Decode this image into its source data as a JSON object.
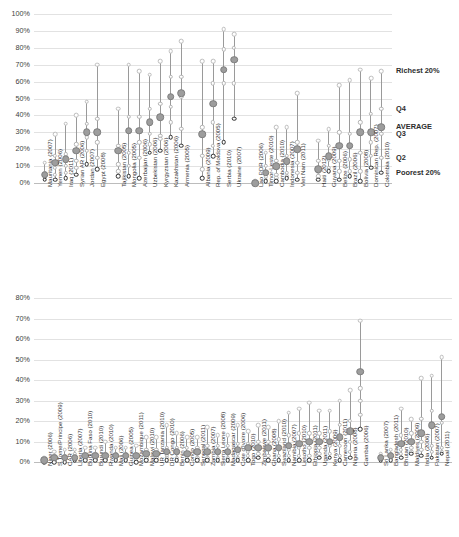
{
  "chart_data": [
    {
      "id": "top",
      "type": "scatter",
      "title": "",
      "xlabel": "",
      "ylabel": "",
      "ylim": [
        0,
        100
      ],
      "ytick_labels": [
        "0%",
        "10%",
        "20%",
        "30%",
        "40%",
        "50%",
        "60%",
        "70%",
        "80%",
        "90%",
        "100%"
      ],
      "ytick_values": [
        0,
        10,
        20,
        30,
        40,
        50,
        60,
        70,
        80,
        90,
        100
      ],
      "grid": true,
      "legend_position": "right",
      "series_names": [
        "Poorest 20%",
        "Q2",
        "Q3",
        "Q4",
        "Richest 20%",
        "AVERAGE"
      ],
      "legend": [
        {
          "label": "Richest 20%",
          "value": 66
        },
        {
          "label": "Q4",
          "value": 44
        },
        {
          "label": "AVERAGE",
          "value": 33
        },
        {
          "label": "Q3",
          "value": 29
        },
        {
          "label": "Q2",
          "value": 15
        },
        {
          "label": "Poorest 20%",
          "value": 6
        }
      ],
      "groups": [
        {
          "name": "group-1",
          "categories": [
            {
              "label": "Mauritania (2007)",
              "poorest": 2,
              "q2": 3,
              "q3": 4,
              "q4": 6,
              "richest": 12,
              "average": 5
            },
            {
              "label": "Yemen (2006)",
              "poorest": 2,
              "q2": 5,
              "q3": 9,
              "q4": 16,
              "richest": 29,
              "average": 12
            },
            {
              "label": "Iraq (2011)",
              "poorest": 3,
              "q2": 6,
              "q3": 10,
              "q4": 17,
              "richest": 35,
              "average": 14
            },
            {
              "label": "Syrian AR (2006)",
              "poorest": 5,
              "q2": 9,
              "q3": 13,
              "q4": 23,
              "richest": 40,
              "average": 19
            },
            {
              "label": "Jordan (2007)",
              "poorest": 11,
              "q2": 19,
              "q3": 27,
              "q4": 35,
              "richest": 48,
              "average": 30
            },
            {
              "label": "Egypt (2008)",
              "poorest": 8,
              "q2": 15,
              "q3": 24,
              "q4": 38,
              "richest": 70,
              "average": 30
            }
          ]
        },
        {
          "name": "group-2",
          "categories": [
            {
              "label": "Tajikistan (2005)",
              "poorest": 4,
              "q2": 7,
              "q3": 11,
              "q4": 22,
              "richest": 44,
              "average": 19
            },
            {
              "label": "Mongolia (2005)",
              "poorest": 4,
              "q2": 10,
              "q3": 18,
              "q4": 39,
              "richest": 70,
              "average": 31
            },
            {
              "label": "Azerbaijan (2006)",
              "poorest": 3,
              "q2": 15,
              "q3": 24,
              "q4": 39,
              "richest": 66,
              "average": 31
            },
            {
              "label": "Uzbekistan (2006)",
              "poorest": 18,
              "q2": 23,
              "q3": 29,
              "q4": 44,
              "richest": 64,
              "average": 36
            },
            {
              "label": "Kyrgyzstan (2006)",
              "poorest": 19,
              "q2": 26,
              "q3": 28,
              "q4": 47,
              "richest": 72,
              "average": 39
            },
            {
              "label": "Kazakhstan (2006)",
              "poorest": 27,
              "q2": 36,
              "q3": 45,
              "q4": 63,
              "richest": 78,
              "average": 51
            },
            {
              "label": "Armenia (2005)",
              "poorest": 22,
              "q2": 32,
              "q3": 51,
              "q4": 63,
              "richest": 84,
              "average": 53
            }
          ]
        },
        {
          "name": "group-3",
          "categories": [
            {
              "label": "Albania (2009)",
              "poorest": 3,
              "q2": 8,
              "q3": 16,
              "q4": 33,
              "richest": 72,
              "average": 29
            },
            {
              "label": "Rep. of Moldova (2005)",
              "poorest": 16,
              "q2": 22,
              "q3": 36,
              "q4": 59,
              "richest": 72,
              "average": 47
            },
            {
              "label": "Serbia (2010)",
              "poorest": 24,
              "q2": 59,
              "q3": 67,
              "q4": 79,
              "richest": 91,
              "average": 67
            },
            {
              "label": "Ukraine (2007)",
              "poorest": 38,
              "q2": 59,
              "q3": 73,
              "q4": 80,
              "richest": 88,
              "average": 73
            }
          ]
        },
        {
          "name": "group-4",
          "categories": [
            {
              "label": "Lao PDR (2006)",
              "poorest": 0,
              "q2": 0,
              "q3": 0,
              "q4": 0,
              "richest": 1,
              "average": 0
            },
            {
              "label": "Timor-Leste (2010)",
              "poorest": 1,
              "q2": 2,
              "q3": 4,
              "q4": 10,
              "richest": 18,
              "average": 6
            },
            {
              "label": "Cambodia (2010)",
              "poorest": 1,
              "q2": 3,
              "q3": 5,
              "q4": 13,
              "richest": 33,
              "average": 10
            },
            {
              "label": "Indonesia (2007)",
              "poorest": 3,
              "q2": 4,
              "q3": 6,
              "q4": 16,
              "richest": 33,
              "average": 13
            },
            {
              "label": "Viet Nam (2011)",
              "poorest": 2,
              "q2": 6,
              "q3": 12,
              "q4": 24,
              "richest": 53,
              "average": 20
            }
          ]
        },
        {
          "name": "group-5",
          "categories": [
            {
              "label": "Haiti (2012)",
              "poorest": 2,
              "q2": 4,
              "q3": 7,
              "q4": 13,
              "richest": 25,
              "average": 8
            },
            {
              "label": "Guyana (2009)",
              "poorest": 7,
              "q2": 9,
              "q3": 14,
              "q4": 22,
              "richest": 32,
              "average": 16
            },
            {
              "label": "Belize (2006)",
              "poorest": 2,
              "q2": 7,
              "q3": 13,
              "q4": 30,
              "richest": 58,
              "average": 22
            },
            {
              "label": "Brazil (2006)",
              "poorest": 4,
              "q2": 7,
              "q3": 14,
              "q4": 29,
              "richest": 61,
              "average": 22
            },
            {
              "label": "Bolivia (2008)",
              "poorest": 1,
              "q2": 7,
              "q3": 18,
              "q4": 36,
              "richest": 67,
              "average": 30
            },
            {
              "label": "Dominican Rep. (2007)",
              "poorest": 9,
              "q2": 16,
              "q3": 24,
              "q4": 41,
              "richest": 62,
              "average": 30
            },
            {
              "label": "Colombia (2010)",
              "poorest": 6,
              "q2": 15,
              "q3": 29,
              "q4": 44,
              "richest": 66,
              "average": 33
            }
          ]
        }
      ]
    },
    {
      "id": "bottom",
      "type": "scatter",
      "title": "",
      "xlabel": "",
      "ylabel": "",
      "ylim": [
        0,
        80
      ],
      "ytick_labels": [
        "0%",
        "10%",
        "20%",
        "30%",
        "40%",
        "50%",
        "60%",
        "70%",
        "80%"
      ],
      "ytick_values": [
        0,
        10,
        20,
        30,
        40,
        50,
        60,
        70,
        80
      ],
      "grid": true,
      "legend_position": "none",
      "series_names": [
        "Poorest 20%",
        "Q2",
        "Q3",
        "Q4",
        "Richest 20%",
        "AVERAGE"
      ],
      "groups": [
        {
          "name": "group-1",
          "categories": [
            {
              "label": "Niger (2006)",
              "poorest": 0,
              "q2": 0,
              "q3": 0,
              "q4": 1,
              "richest": 2,
              "average": 1
            },
            {
              "label": "S.Tome/Principe (2009)",
              "poorest": 0,
              "q2": 1,
              "q3": 2,
              "q4": 3,
              "richest": 5,
              "average": 2
            },
            {
              "label": "CAR (2006)",
              "poorest": 0,
              "q2": 1,
              "q3": 2,
              "q4": 3,
              "richest": 6,
              "average": 2
            },
            {
              "label": "Liberia (2007)",
              "poorest": 1,
              "q2": 1,
              "q3": 2,
              "q4": 4,
              "richest": 6,
              "average": 2
            },
            {
              "label": "Burkina Faso (2010)",
              "poorest": 1,
              "q2": 1,
              "q3": 2,
              "q4": 4,
              "richest": 7,
              "average": 3
            },
            {
              "label": "Burundi (2010)",
              "poorest": 1,
              "q2": 1,
              "q3": 2,
              "q4": 4,
              "richest": 7,
              "average": 3
            },
            {
              "label": "Rwanda (2010)",
              "poorest": 1,
              "q2": 1,
              "q3": 2,
              "q4": 4,
              "richest": 10,
              "average": 3
            },
            {
              "label": "Mali (2006)",
              "poorest": 1,
              "q2": 1,
              "q3": 2,
              "q4": 4,
              "richest": 7,
              "average": 3
            },
            {
              "label": "Guinea (2005)",
              "poorest": 1,
              "q2": 1,
              "q3": 2,
              "q4": 4,
              "richest": 7,
              "average": 3
            },
            {
              "label": "Mozambique (2011)",
              "poorest": 0,
              "q2": 1,
              "q3": 2,
              "q4": 4,
              "richest": 8,
              "average": 3
            },
            {
              "label": "Malawi (2010)",
              "poorest": 1,
              "q2": 2,
              "q3": 3,
              "q4": 6,
              "richest": 12,
              "average": 4
            },
            {
              "label": "UR Tanzania (2010)",
              "poorest": 1,
              "q2": 2,
              "q3": 3,
              "q4": 6,
              "richest": 12,
              "average": 4
            },
            {
              "label": "DR Congo (2010)",
              "poorest": 1,
              "q2": 2,
              "q3": 3,
              "q4": 7,
              "richest": 18,
              "average": 5
            },
            {
              "label": "Benin (2006)",
              "poorest": 1,
              "q2": 2,
              "q3": 4,
              "q4": 7,
              "richest": 14,
              "average": 5
            },
            {
              "label": "Congo (2005)",
              "poorest": 1,
              "q2": 2,
              "q3": 4,
              "q4": 7,
              "richest": 12,
              "average": 4
            },
            {
              "label": "Senegal (2011)",
              "poorest": 1,
              "q2": 2,
              "q3": 4,
              "q4": 7,
              "richest": 12,
              "average": 5
            },
            {
              "label": "Zambia (2007)",
              "poorest": 1,
              "q2": 2,
              "q3": 4,
              "q4": 8,
              "richest": 17,
              "average": 5
            },
            {
              "label": "Sierra Leone (2008)",
              "poorest": 1,
              "q2": 2,
              "q3": 4,
              "q4": 8,
              "richest": 13,
              "average": 5
            },
            {
              "label": "Madagascar (2009)",
              "poorest": 1,
              "q2": 2,
              "q3": 4,
              "q4": 8,
              "richest": 13,
              "average": 5
            },
            {
              "label": "Cote d'Ivoire (2006)",
              "poorest": 1,
              "q2": 2,
              "q3": 4,
              "q4": 9,
              "richest": 18,
              "average": 6
            },
            {
              "label": "Togo (2010)",
              "poorest": 1,
              "q2": 3,
              "q3": 5,
              "q4": 9,
              "richest": 15,
              "average": 7
            },
            {
              "label": "Zimbabwe (2011)",
              "poorest": 2,
              "q2": 4,
              "q3": 6,
              "q4": 10,
              "richest": 18,
              "average": 7
            },
            {
              "label": "Ghana (2008)",
              "poorest": 1,
              "q2": 3,
              "q3": 6,
              "q4": 10,
              "richest": 17,
              "average": 7
            },
            {
              "label": "Swaziland (2010)",
              "poorest": 1,
              "q2": 3,
              "q3": 6,
              "q4": 11,
              "richest": 20,
              "average": 7
            },
            {
              "label": "Namibia (2007)",
              "poorest": 1,
              "q2": 3,
              "q3": 6,
              "q4": 13,
              "richest": 24,
              "average": 8
            },
            {
              "label": "Lesotho (2010)",
              "poorest": 1,
              "q2": 3,
              "q3": 7,
              "q4": 14,
              "richest": 26,
              "average": 9
            },
            {
              "label": "Ethiopia (2011)",
              "poorest": 1,
              "q2": 3,
              "q3": 7,
              "q4": 14,
              "richest": 29,
              "average": 10
            },
            {
              "label": "Uganda (2011)",
              "poorest": 2,
              "q2": 4,
              "q3": 7,
              "q4": 14,
              "richest": 25,
              "average": 10
            },
            {
              "label": "Kenya (2009)",
              "poorest": 2,
              "q2": 4,
              "q3": 8,
              "q4": 15,
              "richest": 25,
              "average": 10
            },
            {
              "label": "Cameroon (2011)",
              "poorest": 1,
              "q2": 3,
              "q3": 8,
              "q4": 18,
              "richest": 30,
              "average": 12
            },
            {
              "label": "Nigeria (2008)",
              "poorest": 2,
              "q2": 5,
              "q3": 10,
              "q4": 20,
              "richest": 35,
              "average": 15
            },
            {
              "label": "Gambia (2006)",
              "poorest": 16,
              "q2": 23,
              "q3": 30,
              "q4": 36,
              "richest": 69,
              "average": 44
            }
          ]
        },
        {
          "name": "group-2",
          "categories": [
            {
              "label": "Sri Lanka (2007)",
              "poorest": 1,
              "q2": 1,
              "q3": 2,
              "q4": 3,
              "richest": 4,
              "average": 2
            },
            {
              "label": "Bangladesh (2011)",
              "poorest": 1,
              "q2": 2,
              "q3": 3,
              "q4": 4,
              "richest": 6,
              "average": 3
            },
            {
              "label": "Bhutan (2010)",
              "poorest": 2,
              "q2": 4,
              "q3": 6,
              "q4": 13,
              "richest": 26,
              "average": 9
            },
            {
              "label": "Maldives (2009)",
              "poorest": 4,
              "q2": 5,
              "q3": 7,
              "q4": 14,
              "richest": 21,
              "average": 10
            },
            {
              "label": "India (2006)",
              "poorest": 3,
              "q2": 6,
              "q3": 10,
              "q4": 21,
              "richest": 41,
              "average": 14
            },
            {
              "label": "Pakistan (2007)",
              "poorest": 2,
              "q2": 5,
              "q3": 8,
              "q4": 25,
              "richest": 42,
              "average": 18
            },
            {
              "label": "Nepal (2011)",
              "poorest": 4,
              "q2": 5,
              "q3": 7,
              "q4": 19,
              "richest": 51,
              "average": 22
            }
          ]
        }
      ]
    }
  ],
  "colors": {
    "average_fill": "#9d9d9d",
    "average_stroke": "#7d7d7d",
    "poorest_stroke": "#2a2a2a",
    "quintile_stroke": "#b4b4b4",
    "richest_stroke": "#bdbdbd",
    "stem": "#9a9a9a",
    "gridline": "#e2e2e2",
    "axis": "#bcbcbc",
    "text": "#3f3f3f"
  }
}
